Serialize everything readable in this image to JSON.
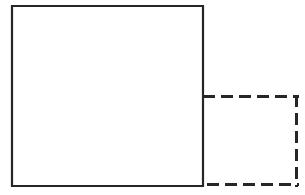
{
  "figure": {
    "canvas": {
      "width": 305,
      "height": 195,
      "background_color": "#ffffff"
    },
    "style": {
      "stroke_color": "#262626",
      "solid_stroke_width": 2.2,
      "dashed_stroke_width": 3,
      "dash_pattern": "12 6",
      "line_cap": "butt"
    },
    "shapes": [
      {
        "name": "solid-square",
        "kind": "rectangle",
        "stroke": "solid",
        "x": 12,
        "y": 6,
        "width": 191,
        "height": 180,
        "points": "12,6 203,6 203,186 12,186"
      },
      {
        "name": "dashed-rectangle",
        "kind": "rectangle",
        "stroke": "dashed",
        "x": 203,
        "y": 95,
        "width": 95,
        "height": 91,
        "points": "203,95 298,95 298,186 203,186"
      }
    ],
    "shared_edge": {
      "name": "shared-right-edge",
      "description": "lower portion of square right edge coincides with dashed rectangle left edge",
      "x": 203,
      "y_start": 95,
      "y_end": 186
    }
  }
}
